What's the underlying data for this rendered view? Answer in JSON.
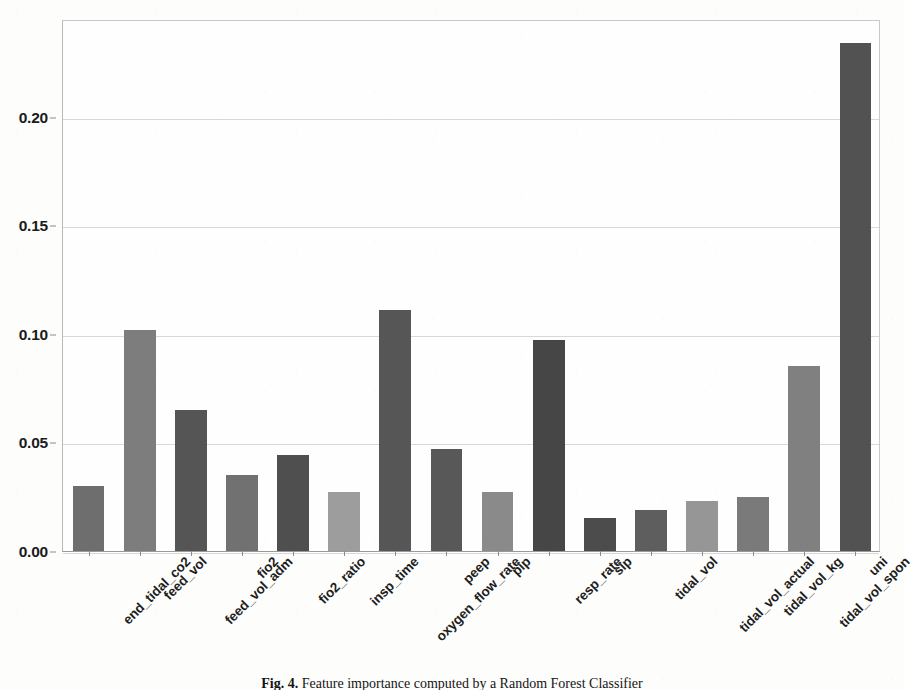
{
  "figure": {
    "caption_label": "Fig. 4.",
    "caption_text": "Feature importance computed by a Random Forest Classifier"
  },
  "chart_data": {
    "type": "bar",
    "title": "",
    "xlabel": "",
    "ylabel": "",
    "ylim": [
      0.0,
      0.245
    ],
    "grid": true,
    "legend": "none",
    "ytick_labels": [
      "0.00",
      "0.05",
      "0.10",
      "0.15",
      "0.20"
    ],
    "ytick_values": [
      0.0,
      0.05,
      0.1,
      0.15,
      0.2
    ],
    "categories": [
      "end_tidal_co2",
      "feed_vol",
      "feed_vol_adm",
      "fio2",
      "fio2_ratio",
      "insp_time",
      "oxygen_flow_rate",
      "peep",
      "pip",
      "resp_rate",
      "sip",
      "tidal_vol",
      "tidal_vol_actual",
      "tidal_vol_kg",
      "tidal_vol_spon",
      "uni"
    ],
    "values": [
      0.03,
      0.102,
      0.065,
      0.035,
      0.044,
      0.027,
      0.111,
      0.047,
      0.027,
      0.097,
      0.015,
      0.019,
      0.023,
      0.025,
      0.085,
      0.234
    ],
    "bar_colors": [
      "#6e6e6e",
      "#7d7d7d",
      "#555555",
      "#717171",
      "#4f4f4f",
      "#9d9d9d",
      "#565656",
      "#585858",
      "#8a8a8a",
      "#464646",
      "#4c4c4c",
      "#5e5e5e",
      "#969696",
      "#7a7a7a",
      "#808080",
      "#525252"
    ]
  }
}
